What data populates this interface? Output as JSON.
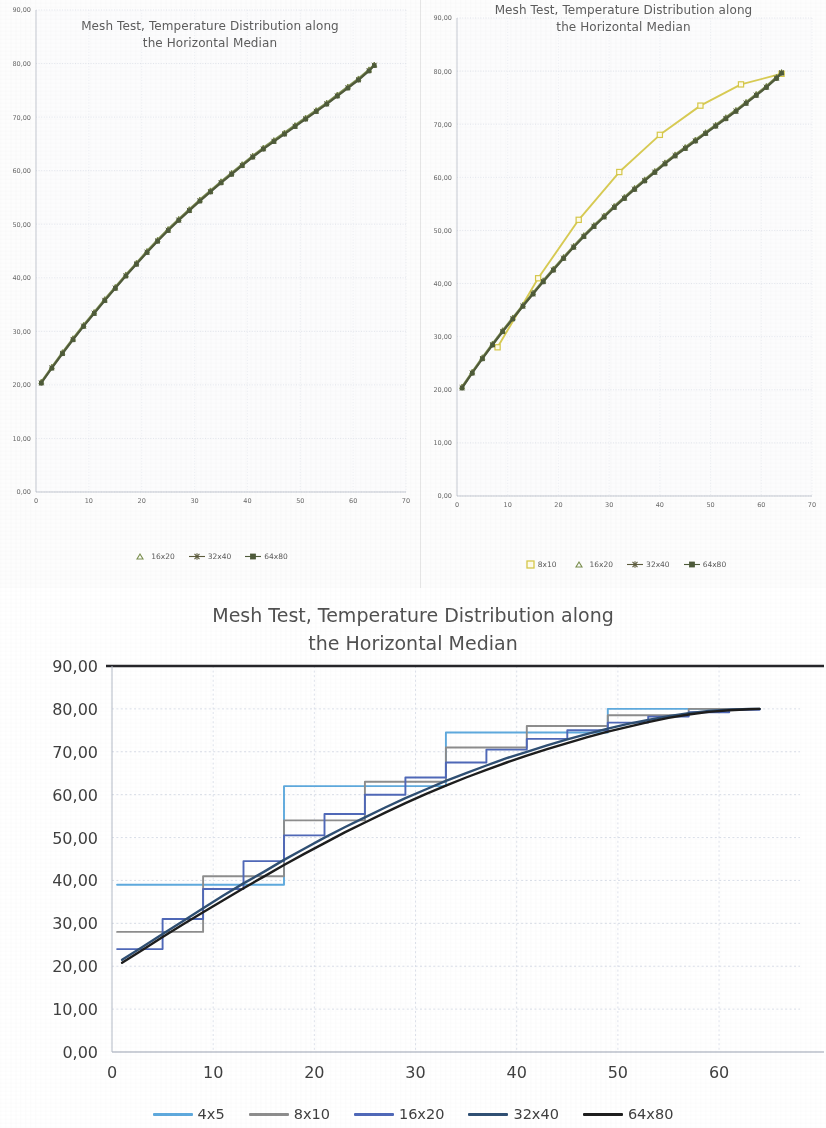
{
  "page": {
    "title": "Mesh Test, Temperature Distribution along the Horizontal Median"
  },
  "charts": {
    "top_left": {
      "title_line1": "Mesh Test, Temperature Distribution along",
      "title_line2": "the Horizontal Median",
      "y_ticks": [
        "90,00",
        "80,00",
        "70,00",
        "60,00",
        "50,00",
        "40,00",
        "30,00",
        "20,00",
        "10,00",
        "0,00"
      ],
      "x_ticks": [
        "0",
        "10",
        "20",
        "30",
        "40",
        "50",
        "60",
        "70"
      ],
      "legend": [
        {
          "label": "16x20",
          "marker": "triangle",
          "color": "#7a8f4e"
        },
        {
          "label": "32x40",
          "marker": "star-line",
          "color": "#5c5b3c"
        },
        {
          "label": "64x80",
          "marker": "square-line",
          "color": "#4e5b3a"
        }
      ]
    },
    "top_right": {
      "title_line1": "Mesh Test, Temperature Distribution along",
      "title_line2": "the Horizontal Median",
      "y_ticks": [
        "90,00",
        "80,00",
        "70,00",
        "60,00",
        "50,00",
        "40,00",
        "30,00",
        "20,00",
        "10,00",
        "0,00"
      ],
      "x_ticks": [
        "0",
        "10",
        "20",
        "30",
        "40",
        "50",
        "60",
        "70"
      ],
      "legend": [
        {
          "label": "8x10",
          "marker": "square",
          "color": "#d6c84a"
        },
        {
          "label": "16x20",
          "marker": "triangle",
          "color": "#7a8f4e"
        },
        {
          "label": "32x40",
          "marker": "star-line",
          "color": "#5c5b3c"
        },
        {
          "label": "64x80",
          "marker": "square-line",
          "color": "#4e5b3a"
        }
      ]
    },
    "bottom": {
      "title_line1": "Mesh Test, Temperature Distribution along",
      "title_line2": "the Horizontal Median",
      "y_ticks": [
        "90,00",
        "80,00",
        "70,00",
        "60,00",
        "50,00",
        "40,00",
        "30,00",
        "20,00",
        "10,00",
        "0,00"
      ],
      "x_ticks": [
        "0",
        "10",
        "20",
        "30",
        "40",
        "50",
        "60"
      ],
      "legend": [
        {
          "label": "4x5",
          "color": "#5ea9dd"
        },
        {
          "label": "8x10",
          "color": "#8d8d8d"
        },
        {
          "label": "16x20",
          "color": "#4f68b8"
        },
        {
          "label": "32x40",
          "color": "#2f4f73"
        },
        {
          "label": "64x80",
          "color": "#1d1d1d"
        }
      ]
    }
  },
  "chart_data": [
    {
      "id": "top_left",
      "type": "scatter",
      "title": "Mesh Test, Temperature Distribution along the Horizontal Median",
      "xlabel": "",
      "ylabel": "",
      "xlim": [
        0,
        70
      ],
      "ylim": [
        0,
        90
      ],
      "xticks": [
        0,
        10,
        20,
        30,
        40,
        50,
        60,
        70
      ],
      "yticks": [
        0,
        10,
        20,
        30,
        40,
        50,
        60,
        70,
        80,
        90
      ],
      "grid": true,
      "legend_position": "bottom",
      "series": [
        {
          "name": "16x20",
          "marker": "triangle",
          "color": "#7a8f4e",
          "x": [
            1,
            3,
            5,
            7,
            9,
            11,
            13,
            15,
            17,
            19,
            21,
            23,
            25,
            27,
            29,
            31,
            33,
            35,
            37,
            39,
            41,
            43,
            45,
            47,
            49,
            51,
            53,
            55,
            57,
            59,
            61,
            63,
            64
          ],
          "y": [
            20.6,
            23.4,
            26.1,
            28.7,
            31.2,
            33.6,
            36.0,
            38.3,
            40.6,
            42.8,
            45.0,
            47.1,
            49.1,
            51.0,
            52.8,
            54.6,
            56.3,
            58.0,
            59.6,
            61.2,
            62.8,
            64.3,
            65.7,
            67.1,
            68.5,
            69.9,
            71.3,
            72.7,
            74.2,
            75.7,
            77.2,
            78.9,
            79.8
          ]
        },
        {
          "name": "32x40",
          "marker": "star-line",
          "color": "#5c5b3c",
          "x": [
            1,
            3,
            5,
            7,
            9,
            11,
            13,
            15,
            17,
            19,
            21,
            23,
            25,
            27,
            29,
            31,
            33,
            35,
            37,
            39,
            41,
            43,
            45,
            47,
            49,
            51,
            53,
            55,
            57,
            59,
            61,
            63,
            64
          ],
          "y": [
            20.4,
            23.2,
            25.9,
            28.5,
            31.0,
            33.4,
            35.8,
            38.1,
            40.4,
            42.6,
            44.8,
            46.9,
            48.9,
            50.8,
            52.6,
            54.4,
            56.1,
            57.8,
            59.4,
            61.0,
            62.6,
            64.1,
            65.5,
            66.9,
            68.3,
            69.7,
            71.1,
            72.5,
            74.0,
            75.5,
            77.0,
            78.7,
            79.7
          ]
        },
        {
          "name": "64x80",
          "marker": "square-line",
          "color": "#4e5b3a",
          "x": [
            1,
            3,
            5,
            7,
            9,
            11,
            13,
            15,
            17,
            19,
            21,
            23,
            25,
            27,
            29,
            31,
            33,
            35,
            37,
            39,
            41,
            43,
            45,
            47,
            49,
            51,
            53,
            55,
            57,
            59,
            61,
            63,
            64
          ],
          "y": [
            20.3,
            23.1,
            25.8,
            28.4,
            30.9,
            33.3,
            35.7,
            38.0,
            40.3,
            42.5,
            44.7,
            46.8,
            48.8,
            50.7,
            52.5,
            54.3,
            56.0,
            57.7,
            59.3,
            60.9,
            62.5,
            64.0,
            65.4,
            66.8,
            68.2,
            69.6,
            71.0,
            72.4,
            73.9,
            75.4,
            76.9,
            78.6,
            79.6
          ]
        }
      ]
    },
    {
      "id": "top_right",
      "type": "scatter",
      "title": "Mesh Test, Temperature Distribution along the Horizontal Median",
      "xlabel": "",
      "ylabel": "",
      "xlim": [
        0,
        70
      ],
      "ylim": [
        0,
        90
      ],
      "xticks": [
        0,
        10,
        20,
        30,
        40,
        50,
        60,
        70
      ],
      "yticks": [
        0,
        10,
        20,
        30,
        40,
        50,
        60,
        70,
        80,
        90
      ],
      "grid": true,
      "legend_position": "bottom",
      "series": [
        {
          "name": "8x10",
          "marker": "square",
          "color": "#d6c84a",
          "x": [
            8,
            16,
            24,
            32,
            40,
            48,
            56,
            64
          ],
          "y": [
            28.0,
            41.0,
            52.0,
            61.0,
            68.0,
            73.5,
            77.5,
            79.5
          ]
        },
        {
          "name": "16x20",
          "marker": "triangle",
          "color": "#7a8f4e",
          "x": [
            1,
            3,
            5,
            7,
            9,
            11,
            13,
            15,
            17,
            19,
            21,
            23,
            25,
            27,
            29,
            31,
            33,
            35,
            37,
            39,
            41,
            43,
            45,
            47,
            49,
            51,
            53,
            55,
            57,
            59,
            61,
            63,
            64
          ],
          "y": [
            20.6,
            23.4,
            26.1,
            28.7,
            31.2,
            33.6,
            36.0,
            38.3,
            40.6,
            42.8,
            45.0,
            47.1,
            49.1,
            51.0,
            52.8,
            54.6,
            56.3,
            58.0,
            59.6,
            61.2,
            62.8,
            64.3,
            65.7,
            67.1,
            68.5,
            69.9,
            71.3,
            72.7,
            74.2,
            75.7,
            77.2,
            78.9,
            79.8
          ]
        },
        {
          "name": "32x40",
          "marker": "star-line",
          "color": "#5c5b3c",
          "x": [
            1,
            3,
            5,
            7,
            9,
            11,
            13,
            15,
            17,
            19,
            21,
            23,
            25,
            27,
            29,
            31,
            33,
            35,
            37,
            39,
            41,
            43,
            45,
            47,
            49,
            51,
            53,
            55,
            57,
            59,
            61,
            63,
            64
          ],
          "y": [
            20.4,
            23.2,
            25.9,
            28.5,
            31.0,
            33.4,
            35.8,
            38.1,
            40.4,
            42.6,
            44.8,
            46.9,
            48.9,
            50.8,
            52.6,
            54.4,
            56.1,
            57.8,
            59.4,
            61.0,
            62.6,
            64.1,
            65.5,
            66.9,
            68.3,
            69.7,
            71.1,
            72.5,
            74.0,
            75.5,
            77.0,
            78.7,
            79.7
          ]
        },
        {
          "name": "64x80",
          "marker": "square-line",
          "color": "#4e5b3a",
          "x": [
            1,
            3,
            5,
            7,
            9,
            11,
            13,
            15,
            17,
            19,
            21,
            23,
            25,
            27,
            29,
            31,
            33,
            35,
            37,
            39,
            41,
            43,
            45,
            47,
            49,
            51,
            53,
            55,
            57,
            59,
            61,
            63,
            64
          ],
          "y": [
            20.3,
            23.1,
            25.8,
            28.4,
            30.9,
            33.3,
            35.7,
            38.0,
            40.3,
            42.5,
            44.7,
            46.8,
            48.8,
            50.7,
            52.5,
            54.3,
            56.0,
            57.7,
            59.3,
            60.9,
            62.5,
            64.0,
            65.4,
            66.8,
            68.2,
            69.6,
            71.0,
            72.4,
            73.9,
            75.4,
            76.9,
            78.6,
            79.6
          ]
        }
      ]
    },
    {
      "id": "bottom",
      "type": "line",
      "title": "Mesh Test, Temperature Distribution along the Horizontal Median",
      "xlabel": "",
      "ylabel": "",
      "xlim": [
        0,
        68
      ],
      "ylim": [
        0,
        90
      ],
      "xticks": [
        0,
        10,
        20,
        30,
        40,
        50,
        60
      ],
      "yticks": [
        0,
        10,
        20,
        30,
        40,
        50,
        60,
        70,
        80,
        90
      ],
      "grid": true,
      "legend_position": "bottom",
      "step": true,
      "series": [
        {
          "name": "4x5",
          "color": "#5ea9dd",
          "x": [
            1,
            17,
            33,
            49,
            64
          ],
          "y": [
            39.0,
            62.0,
            74.5,
            80.0,
            80.0
          ]
        },
        {
          "name": "8x10",
          "color": "#8d8d8d",
          "x": [
            1,
            9,
            17,
            25,
            33,
            41,
            49,
            57,
            64
          ],
          "y": [
            28.0,
            41.0,
            54.0,
            63.0,
            71.0,
            76.0,
            78.5,
            80.0,
            80.0
          ]
        },
        {
          "name": "16x20",
          "color": "#4f68b8",
          "x": [
            1,
            5,
            9,
            13,
            17,
            21,
            25,
            29,
            33,
            37,
            41,
            45,
            49,
            53,
            57,
            61,
            64
          ],
          "y": [
            24.0,
            31.0,
            38.0,
            44.5,
            50.5,
            55.5,
            60.0,
            64.0,
            67.5,
            70.5,
            73.0,
            75.0,
            76.8,
            78.2,
            79.2,
            79.8,
            80.0
          ]
        },
        {
          "name": "32x40",
          "color": "#2f4f73",
          "x": [
            1,
            3,
            5,
            7,
            9,
            11,
            13,
            15,
            17,
            19,
            21,
            23,
            25,
            27,
            29,
            31,
            33,
            35,
            37,
            39,
            41,
            43,
            45,
            47,
            49,
            51,
            53,
            55,
            57,
            59,
            61,
            63,
            64
          ],
          "y": [
            21.5,
            24.5,
            27.5,
            30.5,
            33.5,
            36.5,
            39.3,
            42.0,
            44.8,
            47.4,
            50.0,
            52.4,
            54.7,
            57.0,
            59.2,
            61.2,
            63.2,
            65.0,
            66.8,
            68.5,
            70.0,
            71.5,
            72.9,
            74.2,
            75.4,
            76.5,
            77.4,
            78.3,
            79.0,
            79.5,
            79.8,
            80.0,
            80.0
          ]
        },
        {
          "name": "64x80",
          "color": "#1d1d1d",
          "x": [
            1,
            3,
            5,
            7,
            9,
            11,
            13,
            15,
            17,
            19,
            21,
            23,
            25,
            27,
            29,
            31,
            33,
            35,
            37,
            39,
            41,
            43,
            45,
            47,
            49,
            51,
            53,
            55,
            57,
            59,
            61,
            63,
            64
          ],
          "y": [
            20.8,
            23.8,
            26.8,
            29.7,
            32.6,
            35.4,
            38.2,
            40.9,
            43.6,
            46.2,
            48.7,
            51.2,
            53.5,
            55.8,
            58.0,
            60.1,
            62.1,
            64.0,
            65.8,
            67.5,
            69.1,
            70.6,
            72.0,
            73.4,
            74.7,
            75.8,
            76.9,
            77.9,
            78.7,
            79.3,
            79.7,
            79.9,
            80.0
          ]
        }
      ]
    }
  ]
}
